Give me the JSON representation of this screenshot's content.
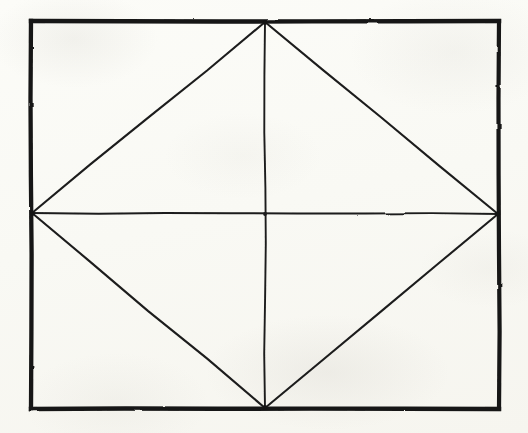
{
  "document": {
    "kind": "hand-drawn-geometric-diagram",
    "title": "Rhombus inscribed in a rectangle with both diagonals drawn",
    "medium": "ink on scanned paper",
    "canvas": {
      "width": 528,
      "height": 433
    },
    "background_color": "#fdfdfb",
    "ink_color": "#1a1a1a"
  },
  "figure": {
    "label": "inscribed-rhombus-figure"
  },
  "shapes": {
    "rectangle": {
      "name": "outer-rectangle",
      "stroke_color": "#141414",
      "stroke_width": 4.2,
      "corners": {
        "top_left": {
          "x": 31,
          "y": 21
        },
        "top_right": {
          "x": 499,
          "y": 21
        },
        "bottom_right": {
          "x": 499,
          "y": 409
        },
        "bottom_left": {
          "x": 31,
          "y": 409
        }
      },
      "width": 468,
      "height": 388
    },
    "rhombus": {
      "name": "inscribed-rhombus",
      "stroke_color": "#1c1c1c",
      "stroke_width": 2.1,
      "vertices": {
        "top": {
          "x": 265,
          "y": 22
        },
        "right": {
          "x": 498,
          "y": 214
        },
        "bottom": {
          "x": 265,
          "y": 408
        },
        "left": {
          "x": 32,
          "y": 213
        }
      },
      "edges": [
        {
          "name": "edge-top-left",
          "from": "top",
          "to": "left"
        },
        {
          "name": "edge-top-right",
          "from": "top",
          "to": "right"
        },
        {
          "name": "edge-bottom-right",
          "from": "right",
          "to": "bottom"
        },
        {
          "name": "edge-bottom-left",
          "from": "bottom",
          "to": "left"
        }
      ]
    },
    "diagonals": {
      "name": "rhombus-diagonals",
      "stroke_color": "#1c1c1c",
      "stroke_width": 1.9,
      "center": {
        "x": 265,
        "y": 214
      },
      "lines": [
        {
          "name": "horizontal-diagonal",
          "orientation": "horizontal",
          "from": {
            "x": 32,
            "y": 213
          },
          "to": {
            "x": 498,
            "y": 214
          },
          "length": 466
        },
        {
          "name": "vertical-diagonal",
          "orientation": "vertical",
          "from": {
            "x": 265,
            "y": 22
          },
          "to": {
            "x": 265,
            "y": 408
          },
          "length": 386
        }
      ]
    }
  },
  "annotations": {
    "text_labels": [],
    "note": "No text, numbers, axis ticks, or legend appear anywhere in the image."
  }
}
